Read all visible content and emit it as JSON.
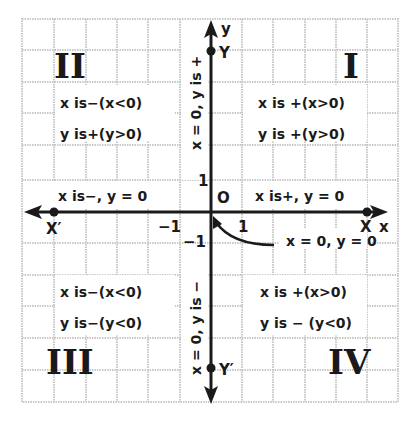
{
  "diagram": {
    "title": "",
    "axes": {
      "x_axis_label": "x",
      "y_axis_label": "y",
      "x_positive_point": "X",
      "x_negative_point": "X′",
      "y_positive_point": "Y",
      "y_negative_point": "Y′",
      "origin_label": "O",
      "tick_x_positive": "1",
      "tick_x_negative": "−1",
      "tick_y_positive": "1",
      "tick_y_negative": "−1"
    },
    "quadrants": {
      "I": {
        "numeral": "I",
        "x_text": "x  is  +(x>0)",
        "y_text": "y  is  +(y>0)"
      },
      "II": {
        "numeral": "II",
        "x_text": "x is−(x<0)",
        "y_text": "y is+(y>0)"
      },
      "III": {
        "numeral": "III",
        "x_text": "x is−(x<0)",
        "y_text": "y is−(y<0)"
      },
      "IV": {
        "numeral": "IV",
        "x_text": "x  is  +(x>0)",
        "y_text": "y  is  − (y<0)"
      }
    },
    "axis_notes": {
      "positive_x_axis": "x is+, y = 0",
      "negative_x_axis": "x is−, y = 0",
      "positive_y_axis": "x = 0, y is +",
      "negative_y_axis": "x = 0, y is −",
      "origin": "x = 0, y = 0"
    },
    "colors": {
      "ink": "#1a1a1a",
      "grid": "#c8c8c8",
      "background": "#ffffff"
    }
  }
}
